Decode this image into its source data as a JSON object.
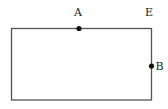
{
  "diagram": {
    "shape": "rectangle",
    "rect": {
      "x": 11.5,
      "y": 28.5,
      "width": 140,
      "height": 71.5
    },
    "stroke_color": "#555555",
    "point_color": "#111111",
    "points": [
      {
        "id": "A",
        "label": "A",
        "x": 79,
        "y": 28.5,
        "label_x": 78,
        "label_y": 16,
        "marked": true
      },
      {
        "id": "E",
        "label": "E",
        "x": 151.5,
        "y": 28.5,
        "label_x": 149,
        "label_y": 16,
        "marked": false
      },
      {
        "id": "B",
        "label": "B",
        "x": 151.5,
        "y": 66,
        "label_x": 159.5,
        "label_y": 70,
        "marked": true
      }
    ]
  }
}
